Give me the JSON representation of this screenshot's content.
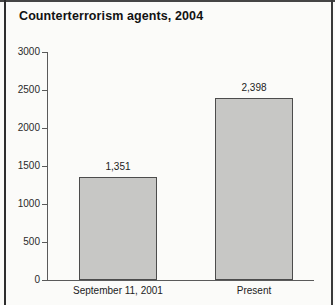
{
  "chart_data": {
    "type": "bar",
    "title": "Counterterrorism agents, 2004",
    "categories": [
      "September 11, 2001",
      "Present"
    ],
    "values": [
      1351,
      2398
    ],
    "value_labels": [
      "1,351",
      "2,398"
    ],
    "xlabel": "",
    "ylabel": "",
    "ylim": [
      0,
      3000
    ],
    "yticks": [
      0,
      500,
      1000,
      1500,
      2000,
      2500,
      3000
    ],
    "ytick_labels": [
      "0",
      "500",
      "1000",
      "1500",
      "2000",
      "2500",
      "3000"
    ],
    "grid": false,
    "legend": false,
    "bar_color": "#c7c7c5",
    "bar_border_color": "#4c4c4c",
    "axis_color": "#5a5a5a",
    "frame_color": "#2e2e2e",
    "background": "#fbfbf9"
  }
}
